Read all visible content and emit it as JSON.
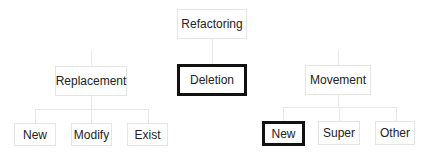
{
  "diagram": {
    "root": {
      "label": "Refactoring",
      "selected": false
    },
    "level1": [
      {
        "id": "replacement",
        "label": "Replacement",
        "selected": false
      },
      {
        "id": "deletion",
        "label": "Deletion",
        "selected": true
      },
      {
        "id": "movement",
        "label": "Movement",
        "selected": false
      }
    ],
    "replacement_children": [
      {
        "id": "replacement-new",
        "label": "New",
        "selected": false
      },
      {
        "id": "replacement-modify",
        "label": "Modify",
        "selected": false
      },
      {
        "id": "replacement-exist",
        "label": "Exist",
        "selected": false
      }
    ],
    "movement_children": [
      {
        "id": "movement-new",
        "label": "New",
        "selected": true
      },
      {
        "id": "movement-super",
        "label": "Super",
        "selected": false
      },
      {
        "id": "movement-other",
        "label": "Other",
        "selected": false
      }
    ],
    "colors": {
      "node_border": "#e4e4e4",
      "selected_border": "#111111",
      "connector": "#e8e8e8",
      "text": "#222222",
      "background": "#ffffff"
    }
  }
}
